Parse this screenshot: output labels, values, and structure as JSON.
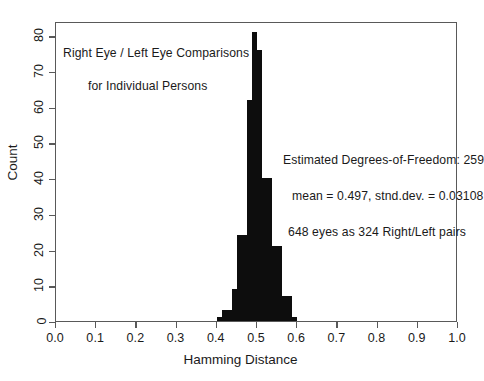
{
  "chart_data": {
    "type": "bar",
    "title": "",
    "xlabel": "Hamming Distance",
    "ylabel": "Count",
    "xlim": [
      0.0,
      1.0
    ],
    "ylim": [
      0,
      84
    ],
    "grid": false,
    "legend": null,
    "bin_width": 0.0125,
    "bin_starts": [
      0.4,
      0.4125,
      0.425,
      0.4375,
      0.45,
      0.4625,
      0.475,
      0.4875,
      0.5,
      0.5125,
      0.525,
      0.5375,
      0.55,
      0.5625,
      0.575,
      0.5875
    ],
    "values": [
      1,
      3,
      3,
      9,
      24,
      24,
      62,
      81,
      76,
      40,
      40,
      21,
      21,
      7,
      7,
      1
    ],
    "xticks": [
      0.0,
      0.1,
      0.2,
      0.3,
      0.4,
      0.5,
      0.6,
      0.7,
      0.8,
      0.9,
      1.0
    ],
    "xtick_labels": [
      "0.0",
      "0.1",
      "0.2",
      "0.3",
      "0.4",
      "0.5",
      "0.6",
      "0.7",
      "0.8",
      "0.9",
      "1.0"
    ],
    "yticks": [
      0,
      10,
      20,
      30,
      40,
      50,
      60,
      70,
      80
    ],
    "ytick_labels": [
      "0",
      "10",
      "20",
      "30",
      "40",
      "50",
      "60",
      "70",
      "80"
    ],
    "bar_color": "#0d0d0d",
    "frame_color": "#595959",
    "annotations": [
      "Right Eye / Left Eye Comparisons",
      "for Individual Persons",
      "Estimated Degrees-of-Freedom: 259",
      "mean = 0.497,  stnd.dev. = 0.03108",
      "648 eyes as 324 Right/Left pairs"
    ]
  },
  "annotations": {
    "title_line1": "Right Eye / Left Eye Comparisons",
    "title_line2": "for Individual Persons",
    "stat_line1": "Estimated Degrees-of-Freedom: 259",
    "stat_line2": "mean = 0.497,  stnd.dev. = 0.03108",
    "stat_line3": "648 eyes as 324 Right/Left pairs"
  },
  "axes": {
    "x_title": "Hamming Distance",
    "y_title": "Count"
  }
}
